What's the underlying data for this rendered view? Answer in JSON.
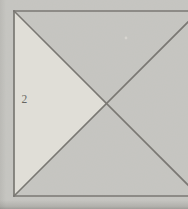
{
  "figure": {
    "label": "2",
    "colors": {
      "background": "#c6c5c1",
      "triangle_fill": "#efede4",
      "line": "#524f4a",
      "label": "#33322e",
      "speck": "#e9e7e0"
    }
  }
}
